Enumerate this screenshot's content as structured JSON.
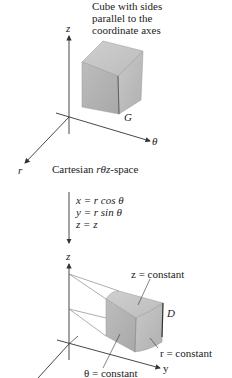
{
  "top_diagram": {
    "annotation_lines": [
      "Cube with sides",
      "parallel to the",
      "coordinate axes"
    ],
    "axes": {
      "z": "z",
      "theta": "θ",
      "r": "r"
    },
    "region_label": "G",
    "caption_prefix": "Cartesian ",
    "caption_italic": "rθz",
    "caption_suffix": "-space"
  },
  "transform": {
    "equations": [
      {
        "lhs": "x",
        "rhs": "r cos θ"
      },
      {
        "lhs": "y",
        "rhs": "r sin θ"
      },
      {
        "lhs": "z",
        "rhs": "z"
      }
    ],
    "eq_strings": [
      "x = r cos θ",
      "y = r sin θ",
      "z = z"
    ]
  },
  "bottom_diagram": {
    "axes": {
      "z": "z",
      "y": "y"
    },
    "region_label": "D",
    "labels": {
      "z_const": "z = constant",
      "r_const": "r = constant",
      "theta_const": "θ = constant"
    }
  },
  "colors": {
    "axis": "#333333",
    "solid_light": "#d4d4d4",
    "solid_mid": "#b8b8b8",
    "solid_dark": "#9e9e9e"
  }
}
